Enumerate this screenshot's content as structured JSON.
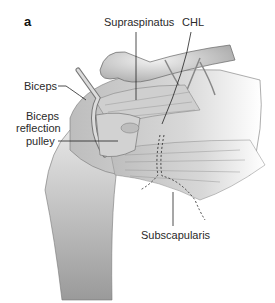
{
  "figure": {
    "panel_label": "a",
    "labels": {
      "supraspinatus": "Supraspinatus",
      "chl": "CHL",
      "biceps": "Biceps",
      "biceps_reflection_pulley_line1": "Biceps",
      "biceps_reflection_pulley_line2": "reflection",
      "biceps_reflection_pulley_line3": "pulley",
      "subscapularis": "Subscapularis"
    }
  }
}
